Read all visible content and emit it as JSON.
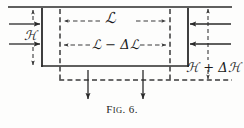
{
  "figure": {
    "caption_prefix": "F",
    "caption_smallcaps": "IG",
    "caption_number": ". 6.",
    "caption_full": "Fig. 6.",
    "labels": {
      "length_top": "ℒ",
      "length_reduced": "ℒ − Δℒ",
      "height_left": "ℋ",
      "height_increased": "ℋ + Δℋ"
    },
    "colors": {
      "ink": "#1a1a1a",
      "background": "#fdfdfc",
      "solid_line": "#2a2a2a",
      "dashed_line": "#3a3a3a"
    },
    "geometry": {
      "solid_rect": {
        "x": 42,
        "y": 9,
        "width": 146,
        "height": 57
      },
      "dashed_rect": {
        "x": 60,
        "y": 9,
        "width": 110,
        "height": 71
      },
      "baseline_y": 7,
      "baseline_x_start": 8,
      "baseline_x_end": 232,
      "right_dashed_x": 208,
      "down_arrow_x": [
        88,
        143
      ],
      "down_arrow_end_y": 100
    },
    "annotations": {
      "top_dimension": "horizontal double arrow spanning inner dashed verticals labelled L",
      "mid_dimension": "horizontal double arrow spanning inner dashed verticals labelled L minus delta L",
      "left_forces": "two rightward arrows into left wall",
      "right_forces": "two leftward arrows into right wall",
      "bottom_forces": "two downward arrows below dashed base",
      "left_height": "vertical double arrow at left wall labelled H",
      "right_height": "vertical double arrow at right labelled H plus delta H"
    }
  }
}
